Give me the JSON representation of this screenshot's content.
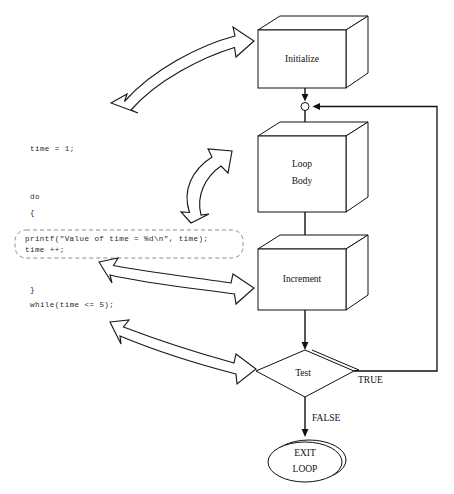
{
  "figure": {
    "type": "flowchart",
    "caption": ""
  },
  "colors": {
    "stroke": "#111111",
    "background": "#ffffff",
    "dashed_outline": "#8d8d8d",
    "code_text": "#2a2a2a"
  },
  "code": {
    "lines": [
      {
        "id": "init",
        "text": "time = 1;"
      },
      {
        "id": "do",
        "text": "do"
      },
      {
        "id": "open-brace",
        "text": "{"
      },
      {
        "id": "printf",
        "text": "printf(\"Value of time = %d\\n\", time);"
      },
      {
        "id": "increment",
        "text": "time ++;"
      },
      {
        "id": "close-brace",
        "text": "}"
      },
      {
        "id": "while",
        "text": "while(time <= 5);"
      }
    ]
  },
  "flowchart": {
    "nodes": [
      {
        "id": "initialize",
        "shape": "cube",
        "label": "Initialize"
      },
      {
        "id": "junction",
        "shape": "circle",
        "label": ""
      },
      {
        "id": "loop-body",
        "shape": "cube",
        "label_line1": "Loop",
        "label_line2": "Body"
      },
      {
        "id": "increment",
        "shape": "cube",
        "label": "Increment"
      },
      {
        "id": "test",
        "shape": "diamond",
        "label": "Test"
      },
      {
        "id": "exit-loop",
        "shape": "ellipse",
        "label_line1": "EXIT",
        "label_line2": "LOOP"
      }
    ],
    "edges": [
      {
        "from": "initialize",
        "to": "junction",
        "label": ""
      },
      {
        "from": "junction",
        "to": "loop-body",
        "label": ""
      },
      {
        "from": "loop-body",
        "to": "increment",
        "label": ""
      },
      {
        "from": "increment",
        "to": "test",
        "label": ""
      },
      {
        "from": "test",
        "to": "junction",
        "label": "TRUE"
      },
      {
        "from": "test",
        "to": "exit-loop",
        "label": "FALSE"
      }
    ],
    "mapping_arrows": [
      {
        "id": "init-map",
        "from": "code-init",
        "to": "initialize",
        "style": "double-headed-curved"
      },
      {
        "id": "body-map",
        "from": "loop-body",
        "to": "code-printf-block",
        "style": "double-headed-curved"
      },
      {
        "id": "increment-map",
        "from": "code-increment",
        "to": "increment",
        "style": "double-headed-curved"
      },
      {
        "id": "test-map",
        "from": "code-while",
        "to": "test",
        "style": "double-headed-curved"
      }
    ]
  }
}
